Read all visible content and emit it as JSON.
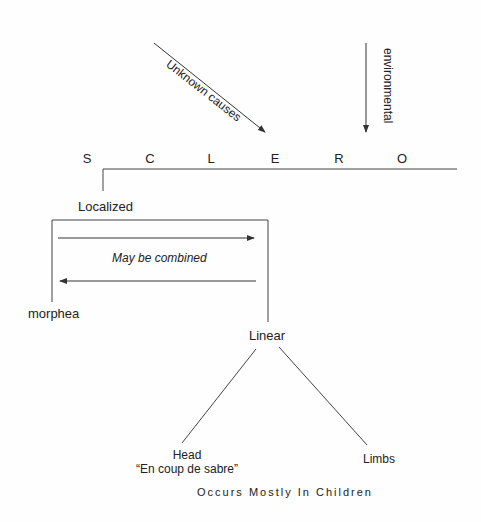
{
  "title_letters": [
    "S",
    "C",
    "L",
    "E",
    "R",
    "O"
  ],
  "causes": {
    "unknown": "Unknown causes",
    "environmental": "environmental"
  },
  "branch": {
    "localized": "Localized",
    "combined_note": "May be combined",
    "morphea": "morphea",
    "linear": "Linear"
  },
  "linear_subtypes": {
    "head_line1": "Head",
    "head_line2": "“En coup de sabre”",
    "limbs": "Limbs"
  },
  "footer": "Occurs Mostly In Children",
  "colors": {
    "line": "#333333",
    "text": "#222222",
    "background": "#fefefe"
  }
}
